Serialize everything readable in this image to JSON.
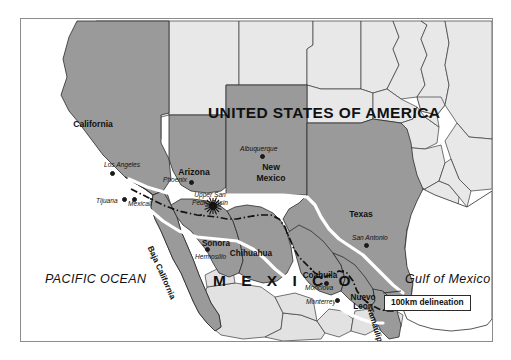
{
  "figure": {
    "kind": "reference-map",
    "title_visible": false,
    "background_color": "#ffffff",
    "frame_color": "#8c8c8c"
  },
  "palette": {
    "border_region_fill": "#9a9a9a",
    "interior_state_fill": "#e8e8e8",
    "mexico_interior_fill": "#d8d8d8",
    "water_fill": "#ffffff",
    "outline": "#2b2b2b",
    "delineation_band": "#ffffff",
    "international_border": "#111111",
    "text": "#111111"
  },
  "countries": [
    {
      "name": "UNITED STATES OF AMERICA",
      "x": 207,
      "y": 94
    },
    {
      "name": "M E X I C O",
      "x": 212,
      "y": 262
    }
  ],
  "water_bodies": [
    {
      "name": "PACIFIC OCEAN",
      "x": 44,
      "y": 262
    },
    {
      "name": "Gulf of Mexico",
      "x": 404,
      "y": 262
    }
  ],
  "us_states": [
    {
      "name": "California",
      "x": 72,
      "y": 108,
      "w": 56
    },
    {
      "name": "Arizona",
      "x": 173,
      "y": 155,
      "w": 50
    },
    {
      "name": "New\nMexico",
      "line1": "New",
      "line2": "Mexico",
      "x": 250,
      "y": 151,
      "w": 48
    },
    {
      "name": "Texas",
      "x": 340,
      "y": 198,
      "w": 44
    }
  ],
  "mexican_states": [
    {
      "name": "Sonora",
      "x": 195,
      "y": 228,
      "w": 44,
      "rotated": false
    },
    {
      "name": "Chihuahua",
      "x": 230,
      "y": 238,
      "w": 56,
      "rotated": false
    },
    {
      "name": "Coahuila",
      "x": 299,
      "y": 260,
      "w": 50,
      "rotated": false
    },
    {
      "name": "Nuevo\nLeon",
      "line1": "Nuevo",
      "line2": "Leon",
      "x": 342,
      "y": 282,
      "w": 38,
      "rotated": false
    },
    {
      "name": "Baja California",
      "x": 152,
      "y": 237,
      "rotated": true,
      "angle": 66
    },
    {
      "name": "Tamaulipas",
      "x": 364,
      "y": 296,
      "rotated": true,
      "angle": 73
    }
  ],
  "cities": [
    {
      "name": "Los Angeles",
      "label_x": 103,
      "label_y": 151,
      "dot_x": 109,
      "dot_y": 160
    },
    {
      "name": "Phoenix",
      "label_x": 162,
      "label_y": 166,
      "dot_x": 188,
      "dot_y": 169
    },
    {
      "name": "Albuquerque",
      "label_x": 239,
      "label_y": 135,
      "dot_x": 259,
      "dot_y": 143
    },
    {
      "name": "San Antonio",
      "label_x": 351,
      "label_y": 224,
      "dot_x": 363,
      "dot_y": 232
    },
    {
      "name": "Tijuana",
      "label_x": 95,
      "label_y": 187,
      "dot_x": 121,
      "dot_y": 186
    },
    {
      "name": "Mexicali",
      "label_x": 127,
      "label_y": 190,
      "dot_x": 131,
      "dot_y": 186
    },
    {
      "name": "Hermosillo",
      "label_x": 194,
      "label_y": 243,
      "dot_x": 204,
      "dot_y": 236
    },
    {
      "name": "Monclova",
      "label_x": 304,
      "label_y": 274,
      "dot_x": 323,
      "dot_y": 270
    },
    {
      "name": "Monterrey",
      "label_x": 305,
      "label_y": 288,
      "dot_x": 334,
      "dot_y": 287
    }
  ],
  "annotations": [
    {
      "name": "Upper San Pedro Basin",
      "line1": "Upper San",
      "line2": "Pedro Basin",
      "x": 185,
      "y": 180,
      "marker": "sunburst-star",
      "marker_x": 212,
      "marker_y": 205
    }
  ],
  "legend": {
    "label": "100km delineation",
    "x": 383,
    "y": 284,
    "leader_from_x": 383,
    "leader_from_y": 291,
    "leader_to_x": 362,
    "leader_to_y": 294
  },
  "map_extent_note": "US–Mexico border region, 100 km buffer either side of the international boundary"
}
